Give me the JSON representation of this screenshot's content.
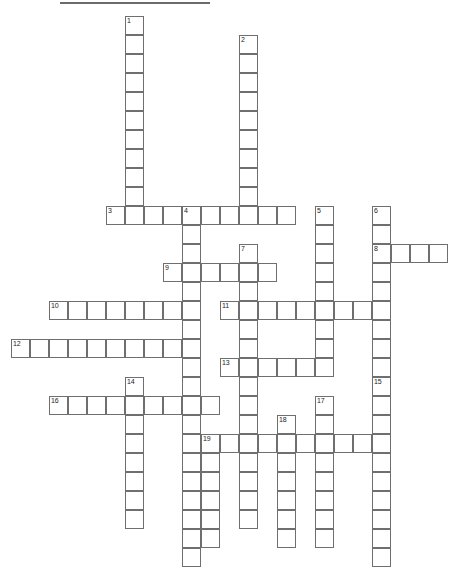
{
  "puzzle": {
    "title": "Crossword Puzzle Grid",
    "cell_size": 19,
    "origin_x": 11,
    "origin_y": 16,
    "grid_cols": 24,
    "grid_rows": 29,
    "colors": {
      "cell_border": "#6f6f6f",
      "cell_fill": "#ffffff",
      "number_text": "#1c1c1c",
      "page_background": "#ffffff",
      "top_rule": "#6b6b6b"
    },
    "entries": [
      {
        "number": "1",
        "direction": "down",
        "col": 6,
        "row": 0,
        "length": 10
      },
      {
        "number": "2",
        "direction": "down",
        "col": 12,
        "row": 1,
        "length": 9
      },
      {
        "number": "3",
        "direction": "across",
        "col": 5,
        "row": 10,
        "length": 10
      },
      {
        "number": "4",
        "direction": "down",
        "col": 9,
        "row": 10,
        "length": 19
      },
      {
        "number": "5",
        "direction": "down",
        "col": 16,
        "row": 10,
        "length": 8
      },
      {
        "number": "6",
        "direction": "down",
        "col": 19,
        "row": 10,
        "length": 10
      },
      {
        "number": "7",
        "direction": "down",
        "col": 12,
        "row": 12,
        "length": 15
      },
      {
        "number": "8",
        "direction": "across",
        "col": 19,
        "row": 12,
        "length": 4
      },
      {
        "number": "9",
        "direction": "across",
        "col": 8,
        "row": 13,
        "length": 6
      },
      {
        "number": "10",
        "direction": "across",
        "col": 2,
        "row": 15,
        "length": 8
      },
      {
        "number": "11",
        "direction": "across",
        "col": 11,
        "row": 15,
        "length": 9
      },
      {
        "number": "12",
        "direction": "across",
        "col": 0,
        "row": 17,
        "length": 10
      },
      {
        "number": "13",
        "direction": "across",
        "col": 11,
        "row": 18,
        "length": 6
      },
      {
        "number": "14",
        "direction": "down",
        "col": 6,
        "row": 19,
        "length": 8
      },
      {
        "number": "15",
        "direction": "down",
        "col": 19,
        "row": 19,
        "length": 10
      },
      {
        "number": "16",
        "direction": "across",
        "col": 2,
        "row": 20,
        "length": 9
      },
      {
        "number": "17",
        "direction": "down",
        "col": 16,
        "row": 20,
        "length": 8
      },
      {
        "number": "18",
        "direction": "down",
        "col": 14,
        "row": 21,
        "length": 7
      },
      {
        "number": "19",
        "direction": "across",
        "col": 10,
        "row": 22,
        "length": 10
      },
      {
        "number": "19d",
        "direction": "down",
        "col": 10,
        "row": 22,
        "length": 6,
        "label": ""
      }
    ]
  }
}
